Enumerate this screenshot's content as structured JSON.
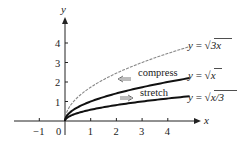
{
  "chart_data": {
    "type": "line",
    "title": "",
    "xlabel": "x",
    "ylabel": "y",
    "xlim": [
      -1.7,
      5.2
    ],
    "ylim": [
      0,
      5
    ],
    "grid": false,
    "x_ticks": [
      -1,
      1,
      2,
      3,
      4
    ],
    "x_tick_labels": [
      "−1",
      "1",
      "2",
      "3",
      "4"
    ],
    "origin_label": "0",
    "y_ticks": [
      1,
      2,
      3,
      4
    ],
    "y_tick_labels": [
      "1",
      "2",
      "3",
      "4"
    ],
    "series": [
      {
        "name": "y = √(3x)",
        "label_y": "y",
        "label_eq": " = √",
        "label_arg": "3x",
        "function": "sqrt(3x)",
        "style": "gray-thin",
        "x": [
          0,
          0.5,
          1,
          2,
          3,
          4,
          4.8
        ],
        "values": [
          0,
          1.22,
          1.73,
          2.45,
          3.0,
          3.46,
          3.79
        ]
      },
      {
        "name": "y = √x",
        "label_y": "y",
        "label_eq": " = √",
        "label_arg": "x",
        "function": "sqrt(x)",
        "style": "black-thick",
        "x": [
          0,
          0.5,
          1,
          2,
          3,
          4,
          4.8
        ],
        "values": [
          0,
          0.71,
          1.0,
          1.41,
          1.73,
          2.0,
          2.19
        ]
      },
      {
        "name": "y = √(x/3)",
        "label_y": "y",
        "label_eq": " = √",
        "label_arg": "x/3",
        "function": "sqrt(x/3)",
        "style": "black-thick",
        "x": [
          0,
          0.5,
          1,
          2,
          3,
          4,
          4.8
        ],
        "values": [
          0,
          0.41,
          0.58,
          0.82,
          1.0,
          1.15,
          1.26
        ]
      }
    ],
    "annotations": [
      {
        "text": "compress",
        "arrow": "left"
      },
      {
        "text": "stretch",
        "arrow": "right"
      }
    ],
    "legend_position": "inline-right"
  }
}
